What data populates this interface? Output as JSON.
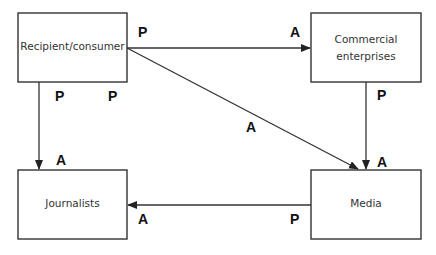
{
  "nodes": {
    "recipient": {
      "label": "Recipient/consumer"
    },
    "commercial": {
      "label_line1": "Commercial",
      "label_line2": "enterprises"
    },
    "journalists": {
      "label": "Journalists"
    },
    "media": {
      "label": "Media"
    }
  },
  "edges": {
    "recipient_to_commercial": {
      "from_label": "P",
      "to_label": "A"
    },
    "recipient_to_media": {
      "from_label": "P",
      "to_label": "A"
    },
    "recipient_to_journalists": {
      "from_label": "P",
      "to_label": "A"
    },
    "commercial_to_media": {
      "from_label": "P",
      "to_label": "A"
    },
    "media_to_journalists": {
      "from_label": "P",
      "to_label": "A"
    }
  },
  "colors": {
    "line": "#333333",
    "text": "#333333"
  }
}
